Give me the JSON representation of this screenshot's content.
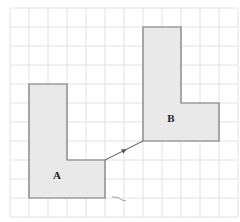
{
  "diagram": {
    "grid": {
      "x0": 10,
      "y0": 8,
      "cell": 19,
      "cols": 12,
      "rows": 11,
      "color": "#e2e2e2"
    },
    "shapes": [
      {
        "label": "A",
        "fill": "#e9e9e9",
        "stroke": "#777777",
        "points": "29,84 67,84 67,160 105,160 105,198 29,198",
        "label_x": 57,
        "label_y": 179
      },
      {
        "label": "B",
        "fill": "#e9e9e9",
        "stroke": "#777777",
        "points": "143,27 181,27 181,103 219,103 219,141 143,141",
        "label_x": 171,
        "label_y": 122
      }
    ],
    "arrow": {
      "x1": 105,
      "y1": 160,
      "x2": 143,
      "y2": 141
    }
  }
}
